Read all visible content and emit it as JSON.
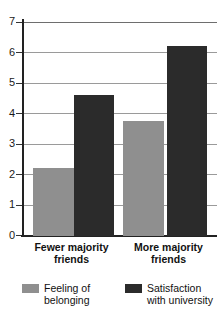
{
  "chart_data": {
    "type": "bar",
    "title": "",
    "subtitle": "",
    "xlabel": "",
    "ylabel": "",
    "ylim": [
      0,
      7
    ],
    "yticks": [
      0,
      1,
      2,
      3,
      4,
      5,
      6,
      7
    ],
    "ytick_labels": [
      "0",
      "1",
      "2",
      "3",
      "4",
      "5",
      "6",
      "7"
    ],
    "grid": true,
    "grid_axis": "y",
    "legend_position": "bottom",
    "categories": [
      "Fewer majority friends",
      "More majority friends"
    ],
    "category_lines": [
      [
        "Fewer majority",
        "friends"
      ],
      [
        "More majority",
        "friends"
      ]
    ],
    "series": [
      {
        "name": "Feeling of belonging",
        "name_lines": [
          "Feeling of",
          "belonging"
        ],
        "color": "#8f8f8f",
        "values": [
          2.22,
          3.75
        ]
      },
      {
        "name": "Satisfaction with university",
        "name_lines": [
          "Satisfaction",
          "with university"
        ],
        "color": "#2b2b2b",
        "values": [
          4.62,
          6.22
        ]
      }
    ]
  },
  "axis": {
    "line_color": "#222222",
    "grid_color": "#9a9a9a"
  }
}
